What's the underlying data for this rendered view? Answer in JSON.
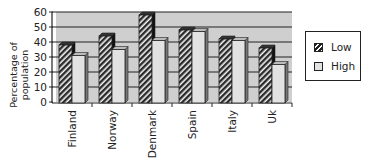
{
  "chart_data": {
    "type": "bar",
    "title": "",
    "xlabel": "",
    "ylabel": "Percentage of population",
    "ylabel_lines": [
      "Percentage of",
      "population"
    ],
    "ylim": [
      0,
      60
    ],
    "yticks": [
      0,
      10,
      20,
      30,
      40,
      50,
      60
    ],
    "grid": true,
    "legend_position": "right",
    "categories": [
      "Finland",
      "Norway",
      "Denmark",
      "Spain",
      "Italy",
      "Uk"
    ],
    "series": [
      {
        "name": "Low",
        "values": [
          38,
          44,
          58,
          48,
          42,
          36
        ],
        "pattern": "hatched",
        "color": "#2a2a2a"
      },
      {
        "name": "High",
        "values": [
          31,
          35,
          41,
          47,
          41,
          25
        ],
        "pattern": "solid",
        "color": "#d9d9d9"
      }
    ]
  },
  "colors": {
    "plot_background": "#cfcfcf",
    "grid": "#222222",
    "high_fill": "#e2e2e2",
    "low_fill": "#2a2a2a"
  }
}
